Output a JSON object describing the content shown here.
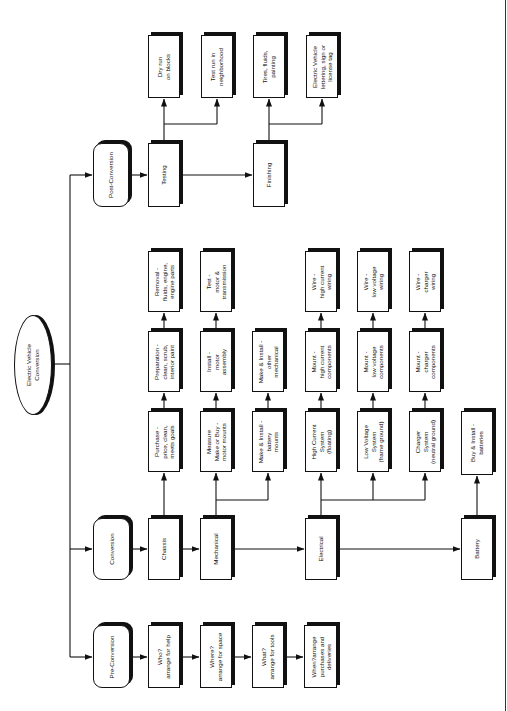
{
  "diagram": {
    "title": "Electric Vehicle Conversion",
    "orientation": "rotated 90deg counter-clockwise (text reads bottom-to-top)",
    "root": {
      "id": "root",
      "label": "Electric Vehicle\nConversion",
      "shape": "ellipse"
    },
    "nodes": [
      {
        "id": "post_conversion",
        "label": "Post-Conversion",
        "shape": "rounded",
        "x": 93,
        "y": 143,
        "w": 36,
        "h": 64
      },
      {
        "id": "testing",
        "label": "Testing",
        "shape": "rect",
        "x": 148,
        "y": 143,
        "w": 32,
        "h": 64
      },
      {
        "id": "finishing",
        "label": "Finishing",
        "shape": "rect",
        "x": 253,
        "y": 143,
        "w": 32,
        "h": 64
      },
      {
        "id": "dry_run",
        "label": "Dry run\non blocks",
        "shape": "rect",
        "x": 148,
        "y": 35,
        "w": 32,
        "h": 63
      },
      {
        "id": "test_run",
        "label": "Test run in\nneighborhood",
        "shape": "rect",
        "x": 201,
        "y": 35,
        "w": 32,
        "h": 63
      },
      {
        "id": "tires",
        "label": "Tires, fluids,\npainting",
        "shape": "rect",
        "x": 253,
        "y": 35,
        "w": 32,
        "h": 63
      },
      {
        "id": "ev_lettering",
        "label": "Electric Vehicle\nlettering, sign or\nlicense tag",
        "shape": "rect",
        "x": 306,
        "y": 35,
        "w": 32,
        "h": 63
      },
      {
        "id": "conversion",
        "label": "Conversion",
        "shape": "rounded",
        "x": 93,
        "y": 518,
        "w": 37,
        "h": 62
      },
      {
        "id": "chassis",
        "label": "Chassis",
        "shape": "rect",
        "x": 148,
        "y": 518,
        "w": 32,
        "h": 62
      },
      {
        "id": "mechanical",
        "label": "Mechanical",
        "shape": "rect",
        "x": 200,
        "y": 518,
        "w": 32,
        "h": 62
      },
      {
        "id": "electrical",
        "label": "Electrical",
        "shape": "rect",
        "x": 305,
        "y": 518,
        "w": 32,
        "h": 62
      },
      {
        "id": "battery",
        "label": "Battery",
        "shape": "rect",
        "x": 461,
        "y": 518,
        "w": 32,
        "h": 62
      },
      {
        "id": "purchase",
        "label": "Purchase -\nprice, clean,\nmeets goals",
        "shape": "rect",
        "x": 148,
        "y": 411,
        "w": 32,
        "h": 61
      },
      {
        "id": "preparation",
        "label": "Preparation -\nclean, scrub,\ninterior paint",
        "shape": "rect",
        "x": 148,
        "y": 331,
        "w": 32,
        "h": 61
      },
      {
        "id": "removal",
        "label": "Removal -\nfluids, engine,\nengine parts",
        "shape": "rect",
        "x": 148,
        "y": 251,
        "w": 32,
        "h": 61
      },
      {
        "id": "measure",
        "label": "Measure\nMake or Buy -\nmotor mounts",
        "shape": "rect",
        "x": 200,
        "y": 411,
        "w": 32,
        "h": 61
      },
      {
        "id": "install_motor",
        "label": "Install -\nmotor\nassembly",
        "shape": "rect",
        "x": 200,
        "y": 331,
        "w": 32,
        "h": 61
      },
      {
        "id": "test_motor",
        "label": "Test -\nmotor &\ntransmission",
        "shape": "rect",
        "x": 200,
        "y": 251,
        "w": 32,
        "h": 61
      },
      {
        "id": "battery_mounts",
        "label": "Make & Install -\nbattery\nmounts",
        "shape": "rect",
        "x": 252,
        "y": 411,
        "w": 32,
        "h": 61
      },
      {
        "id": "other_mechanical",
        "label": "Make & Install -\nother\nmechanical",
        "shape": "rect",
        "x": 252,
        "y": 331,
        "w": 32,
        "h": 61
      },
      {
        "id": "high_current_system",
        "label": "High Current\nSystem\n(floating)",
        "shape": "rect",
        "x": 305,
        "y": 411,
        "w": 32,
        "h": 61
      },
      {
        "id": "mount_high_current",
        "label": "Mount -\nhigh current\ncomponents",
        "shape": "rect",
        "x": 305,
        "y": 331,
        "w": 32,
        "h": 61
      },
      {
        "id": "wire_high_current",
        "label": "Wire -\nhigh current\nwiring",
        "shape": "rect",
        "x": 305,
        "y": 251,
        "w": 32,
        "h": 61
      },
      {
        "id": "low_voltage_system",
        "label": "Low Voltage\nSystem\n(frame ground)",
        "shape": "rect",
        "x": 357,
        "y": 411,
        "w": 32,
        "h": 61
      },
      {
        "id": "mount_low_voltage",
        "label": "Mount -\nlow voltage\ncomponents",
        "shape": "rect",
        "x": 357,
        "y": 331,
        "w": 32,
        "h": 61
      },
      {
        "id": "wire_low_voltage",
        "label": "Wire -\nlow voltage\nwiring",
        "shape": "rect",
        "x": 357,
        "y": 251,
        "w": 32,
        "h": 61
      },
      {
        "id": "charger_system",
        "label": "Charger\nSystem\n(neutral ground)",
        "shape": "rect",
        "x": 409,
        "y": 411,
        "w": 32,
        "h": 61
      },
      {
        "id": "mount_charger",
        "label": "Mount -\ncharger\ncomponents",
        "shape": "rect",
        "x": 409,
        "y": 331,
        "w": 32,
        "h": 61
      },
      {
        "id": "wire_charger",
        "label": "Wire -\ncharger\nwiring",
        "shape": "rect",
        "x": 409,
        "y": 251,
        "w": 32,
        "h": 61
      },
      {
        "id": "buy_install_batteries",
        "label": "Buy & Install -\nbatteries",
        "shape": "rect",
        "x": 461,
        "y": 411,
        "w": 32,
        "h": 64
      },
      {
        "id": "pre_conversion",
        "label": "Pre-Conversion",
        "shape": "rounded",
        "x": 93,
        "y": 625,
        "w": 37,
        "h": 63
      },
      {
        "id": "who",
        "label": "Who?\narrange for help",
        "shape": "rect",
        "x": 148,
        "y": 625,
        "w": 32,
        "h": 63
      },
      {
        "id": "where",
        "label": "Where?\narrange for space",
        "shape": "rect",
        "x": 200,
        "y": 625,
        "w": 32,
        "h": 63
      },
      {
        "id": "what",
        "label": "What?\narrange for tools",
        "shape": "rect",
        "x": 252,
        "y": 625,
        "w": 32,
        "h": 63
      },
      {
        "id": "when",
        "label": "When?arrange\npurchases and\ndeliveries",
        "shape": "rect",
        "x": 304,
        "y": 625,
        "w": 33,
        "h": 63
      }
    ],
    "edges": [
      [
        "root",
        "post_conversion"
      ],
      [
        "root",
        "conversion"
      ],
      [
        "root",
        "pre_conversion"
      ],
      [
        "post_conversion",
        "testing"
      ],
      [
        "testing",
        "finishing"
      ],
      [
        "testing",
        "dry_run"
      ],
      [
        "testing",
        "test_run"
      ],
      [
        "finishing",
        "tires"
      ],
      [
        "finishing",
        "ev_lettering"
      ],
      [
        "conversion",
        "chassis"
      ],
      [
        "chassis",
        "mechanical"
      ],
      [
        "mechanical",
        "electrical"
      ],
      [
        "electrical",
        "battery"
      ],
      [
        "chassis",
        "purchase"
      ],
      [
        "purchase",
        "preparation"
      ],
      [
        "preparation",
        "removal"
      ],
      [
        "mechanical",
        "measure"
      ],
      [
        "mechanical",
        "battery_mounts"
      ],
      [
        "measure",
        "install_motor"
      ],
      [
        "install_motor",
        "test_motor"
      ],
      [
        "battery_mounts",
        "other_mechanical"
      ],
      [
        "electrical",
        "high_current_system"
      ],
      [
        "electrical",
        "low_voltage_system"
      ],
      [
        "electrical",
        "charger_system"
      ],
      [
        "high_current_system",
        "mount_high_current"
      ],
      [
        "mount_high_current",
        "wire_high_current"
      ],
      [
        "low_voltage_system",
        "mount_low_voltage"
      ],
      [
        "mount_low_voltage",
        "wire_low_voltage"
      ],
      [
        "charger_system",
        "mount_charger"
      ],
      [
        "mount_charger",
        "wire_charger"
      ],
      [
        "battery",
        "buy_install_batteries"
      ],
      [
        "pre_conversion",
        "who"
      ],
      [
        "who",
        "where"
      ],
      [
        "where",
        "what"
      ],
      [
        "what",
        "when"
      ]
    ]
  },
  "labels": {
    "root": "Electric Vehicle\nConversion",
    "post_conversion": "Post-Conversion",
    "testing": "Testing",
    "finishing": "Finishing",
    "dry_run": "Dry run\non blocks",
    "test_run": "Test run in\nneighborhood",
    "tires": "Tires, fluids,\npainting",
    "ev_lettering": "Electric Vehicle\nlettering, sign or\nlicense tag",
    "conversion": "Conversion",
    "chassis": "Chassis",
    "mechanical": "Mechanical",
    "electrical": "Electrical",
    "battery": "Battery",
    "purchase": "Purchase -\nprice, clean,\nmeets goals",
    "preparation": "Preparation -\nclean, scrub,\ninterior paint",
    "removal": "Removal -\nfluids, engine,\nengine parts",
    "measure": "Measure\nMake or Buy -\nmotor mounts",
    "install_motor": "Install -\nmotor\nassembly",
    "test_motor": "Test -\nmotor &\ntransmission",
    "battery_mounts": "Make & Install -\nbattery\nmounts",
    "other_mechanical": "Make & Install -\nother\nmechanical",
    "high_current_system": "High Current\nSystem\n(floating)",
    "mount_high_current": "Mount -\nhigh current\ncomponents",
    "wire_high_current": "Wire -\nhigh current\nwiring",
    "low_voltage_system": "Low Voltage\nSystem\n(frame ground)",
    "mount_low_voltage": "Mount -\nlow voltage\ncomponents",
    "wire_low_voltage": "Wire -\nlow voltage\nwiring",
    "charger_system": "Charger\nSystem\n(neutral ground)",
    "mount_charger": "Mount -\ncharger\ncomponents",
    "wire_charger": "Wire -\ncharger\nwiring",
    "buy_install_batteries": "Buy & Install -\nbatteries",
    "pre_conversion": "Pre-Conversion",
    "who": "Who?\narrange for help",
    "where": "Where?\narrange for space",
    "what": "What?\narrange for tools",
    "when": "When?arrange\npurchases and\ndeliveries"
  },
  "colors": {
    "ink": "#111111",
    "background": "#ffffff"
  }
}
